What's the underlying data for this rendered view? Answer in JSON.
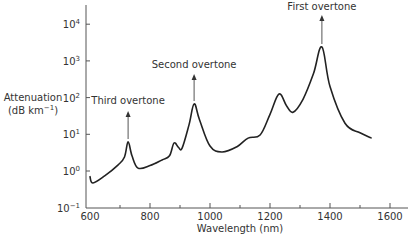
{
  "chart_data": {
    "type": "line",
    "title": "",
    "xlabel": "Wavelength (nm)",
    "ylabel_line1": "Attenuation",
    "ylabel_line2": "(dB km⁻¹)",
    "yscale": "log",
    "xlim": [
      600,
      1650
    ],
    "ylim": [
      0.1,
      30000
    ],
    "x_ticks": [
      600,
      800,
      1000,
      1200,
      1400,
      1600
    ],
    "x_tick_labels": [
      "600",
      "800",
      "1000",
      "1200",
      "1400",
      "1600"
    ],
    "x_minor_ticks": [
      700,
      900,
      1100,
      1300,
      1500
    ],
    "y_ticks": [
      0.1,
      1,
      10,
      100,
      1000,
      10000
    ],
    "y_tick_labels": [
      {
        "base": "10",
        "exp": "−1"
      },
      {
        "base": "10",
        "exp": "0"
      },
      {
        "base": "10",
        "exp": "1"
      },
      {
        "base": "10",
        "exp": "2"
      },
      {
        "base": "10",
        "exp": "3"
      },
      {
        "base": "10",
        "exp": "4"
      }
    ],
    "grid": false,
    "legend": null,
    "series": [
      {
        "name": "Attenuation",
        "x": [
          600,
          610,
          650,
          693,
          715,
          727,
          740,
          760,
          800,
          840,
          865,
          880,
          895,
          907,
          930,
          947,
          965,
          1000,
          1040,
          1090,
          1127,
          1167,
          1200,
          1230,
          1255,
          1277,
          1310,
          1345,
          1373,
          1400,
          1450,
          1500,
          1537
        ],
        "y": [
          0.7,
          0.47,
          0.75,
          1.45,
          2.4,
          6.2,
          2.6,
          1.2,
          1.4,
          2.0,
          2.6,
          5.8,
          4.4,
          4.2,
          18,
          67,
          25,
          4.8,
          3.3,
          4.6,
          7.9,
          9.6,
          35,
          125,
          60,
          40,
          90,
          450,
          2400,
          200,
          20,
          11,
          8
        ]
      }
    ],
    "annotations": [
      {
        "text": "Third overtone",
        "x": 727,
        "y": 6.2
      },
      {
        "text": "Second overtone",
        "x": 947,
        "y": 67
      },
      {
        "text": "First overtone",
        "x": 1373,
        "y": 2400
      }
    ]
  }
}
